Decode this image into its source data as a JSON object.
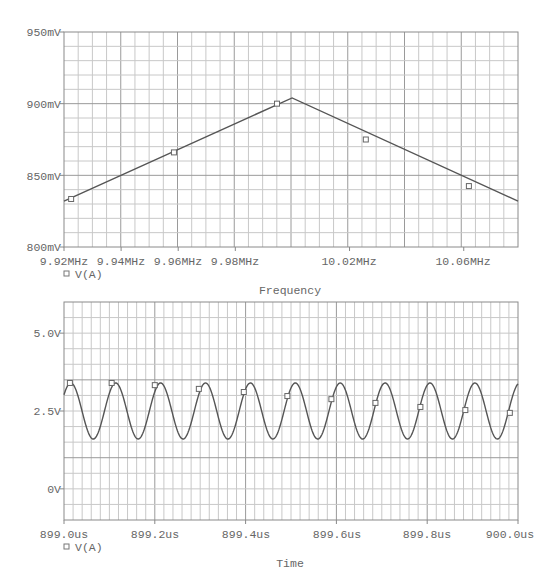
{
  "chart_data": [
    {
      "type": "line",
      "title": "",
      "xlabel": "Frequency",
      "ylabel": "",
      "legend": [
        {
          "marker": "square",
          "label": "V(A)"
        }
      ],
      "legend_position": "below-left",
      "grid": true,
      "xlim": [
        9.92,
        10.079
      ],
      "ylim": [
        800,
        950
      ],
      "x_unit": "MHz",
      "y_unit": "mV",
      "x_ticks": [
        9.92,
        9.94,
        9.96,
        9.98,
        10.02,
        10.06
      ],
      "x_tick_labels": [
        "9.92MHz",
        "9.94MHz",
        "9.96MHz",
        "9.98MHz",
        "10.02MHz",
        "10.06MHz"
      ],
      "y_ticks": [
        800,
        850,
        900,
        950
      ],
      "y_tick_labels": [
        "800mV",
        "850mV",
        "900mV",
        "950mV"
      ],
      "series": [
        {
          "name": "V(A)",
          "x": [
            9.92,
            9.9999,
            10.079
          ],
          "values": [
            832,
            904,
            832
          ],
          "markers_x": [
            9.9225,
            9.9585,
            9.9946,
            10.0257,
            10.0618
          ],
          "markers_y": [
            833.5,
            866,
            900,
            875,
            842.5
          ]
        }
      ]
    },
    {
      "type": "line",
      "title": "",
      "xlabel": "Time",
      "ylabel": "",
      "legend": [
        {
          "marker": "square",
          "label": "V(A)"
        }
      ],
      "legend_position": "below-left",
      "grid": true,
      "xlim": [
        899.0,
        900.0
      ],
      "ylim": [
        -1.0,
        6.0
      ],
      "x_unit": "us",
      "y_unit": "V",
      "x_ticks": [
        899.0,
        899.2,
        899.4,
        899.6,
        899.8,
        900.0
      ],
      "x_tick_labels": [
        "899.0us",
        "899.2us",
        "899.4us",
        "899.6us",
        "899.8us",
        "900.0us"
      ],
      "y_ticks": [
        0,
        2.5,
        5.0
      ],
      "y_tick_labels": [
        "0V",
        "2.5V",
        "5.0V"
      ],
      "series": [
        {
          "name": "V(A)",
          "waveform": "sine",
          "offset_V": 2.5,
          "amplitude_V": 0.9,
          "period_us": 0.0989,
          "first_peak_us": 899.015,
          "markers_x": [
            899.013,
            899.105,
            899.2,
            899.297,
            899.396,
            899.492,
            899.589,
            899.686,
            899.785,
            899.884,
            899.982
          ],
          "markers_y": [
            3.4,
            3.4,
            3.33,
            3.21,
            3.11,
            2.98,
            2.88,
            2.76,
            2.63,
            2.53,
            2.44
          ]
        }
      ]
    }
  ],
  "top_plot": {
    "y_labels": [
      "950mV",
      "900mV",
      "850mV",
      "800mV"
    ],
    "x_labels": [
      "9.92MHz",
      "9.94MHz",
      "9.96MHz",
      "9.98MHz",
      "10.02MHz",
      "10.06MHz"
    ],
    "legend_label": "V(A)",
    "axis_title": "Frequency"
  },
  "bottom_plot": {
    "y_labels": [
      "5.0V",
      "2.5V",
      "0V"
    ],
    "x_labels": [
      "899.0us",
      "899.2us",
      "899.4us",
      "899.6us",
      "899.8us",
      "900.0us"
    ],
    "legend_label": "V(A)",
    "axis_title": "Time"
  },
  "colors": {
    "trace": "#555555",
    "grid_minor": "#c8c8c8",
    "grid_major": "#9a9a9a",
    "frame": "#888888",
    "text": "#666666"
  }
}
